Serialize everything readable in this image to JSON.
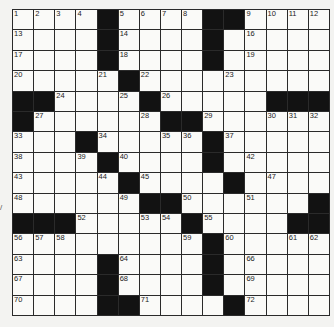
{
  "puzzle": {
    "rows": 15,
    "cols": 15,
    "grid": [
      "....#....##....",
      "....#....#.....",
      "....#....#.....",
      ".....#.........",
      "##....#.....###",
      "#......##......",
      "...#.....#.....",
      "....#....#.....",
      ".....#....#....",
      "......##......#",
      "###.....#....##",
      ".........#.....",
      "....#....#.....",
      "....#....#.....",
      "....##....#...."
    ],
    "numbers": [
      {
        "n": "1",
        "r": 0,
        "c": 0
      },
      {
        "n": "2",
        "r": 0,
        "c": 1
      },
      {
        "n": "3",
        "r": 0,
        "c": 2
      },
      {
        "n": "4",
        "r": 0,
        "c": 3
      },
      {
        "n": "5",
        "r": 0,
        "c": 5
      },
      {
        "n": "6",
        "r": 0,
        "c": 6
      },
      {
        "n": "7",
        "r": 0,
        "c": 7
      },
      {
        "n": "8",
        "r": 0,
        "c": 8
      },
      {
        "n": "9",
        "r": 0,
        "c": 11
      },
      {
        "n": "10",
        "r": 0,
        "c": 12
      },
      {
        "n": "11",
        "r": 0,
        "c": 13
      },
      {
        "n": "12",
        "r": 0,
        "c": 14
      },
      {
        "n": "13",
        "r": 1,
        "c": 0
      },
      {
        "n": "14",
        "r": 1,
        "c": 5
      },
      {
        "n": "15",
        "r": 1,
        "c": 9
      },
      {
        "n": "16",
        "r": 1,
        "c": 11
      },
      {
        "n": "17",
        "r": 2,
        "c": 0
      },
      {
        "n": "18",
        "r": 2,
        "c": 5
      },
      {
        "n": "19",
        "r": 2,
        "c": 11
      },
      {
        "n": "20",
        "r": 3,
        "c": 0
      },
      {
        "n": "21",
        "r": 3,
        "c": 4
      },
      {
        "n": "22",
        "r": 3,
        "c": 6
      },
      {
        "n": "23",
        "r": 3,
        "c": 10
      },
      {
        "n": "24",
        "r": 4,
        "c": 2
      },
      {
        "n": "25",
        "r": 4,
        "c": 5
      },
      {
        "n": "26",
        "r": 4,
        "c": 7
      },
      {
        "n": "27",
        "r": 5,
        "c": 1
      },
      {
        "n": "28",
        "r": 5,
        "c": 6
      },
      {
        "n": "29",
        "r": 5,
        "c": 9
      },
      {
        "n": "30",
        "r": 5,
        "c": 12
      },
      {
        "n": "31",
        "r": 5,
        "c": 13
      },
      {
        "n": "32",
        "r": 5,
        "c": 14
      },
      {
        "n": "33",
        "r": 6,
        "c": 0
      },
      {
        "n": "34",
        "r": 6,
        "c": 4
      },
      {
        "n": "35",
        "r": 6,
        "c": 7
      },
      {
        "n": "36",
        "r": 6,
        "c": 8
      },
      {
        "n": "37",
        "r": 6,
        "c": 10
      },
      {
        "n": "38",
        "r": 7,
        "c": 0
      },
      {
        "n": "39",
        "r": 7,
        "c": 3
      },
      {
        "n": "40",
        "r": 7,
        "c": 5
      },
      {
        "n": "41",
        "r": 7,
        "c": 9
      },
      {
        "n": "42",
        "r": 7,
        "c": 11
      },
      {
        "n": "43",
        "r": 8,
        "c": 0
      },
      {
        "n": "44",
        "r": 8,
        "c": 4
      },
      {
        "n": "45",
        "r": 8,
        "c": 6
      },
      {
        "n": "46",
        "r": 8,
        "c": 10
      },
      {
        "n": "47",
        "r": 8,
        "c": 12
      },
      {
        "n": "48",
        "r": 9,
        "c": 0
      },
      {
        "n": "49",
        "r": 9,
        "c": 5
      },
      {
        "n": "50",
        "r": 9,
        "c": 8
      },
      {
        "n": "51",
        "r": 9,
        "c": 11
      },
      {
        "n": "52",
        "r": 10,
        "c": 3
      },
      {
        "n": "53",
        "r": 10,
        "c": 6
      },
      {
        "n": "54",
        "r": 10,
        "c": 7
      },
      {
        "n": "55",
        "r": 10,
        "c": 9
      },
      {
        "n": "56",
        "r": 11,
        "c": 0
      },
      {
        "n": "57",
        "r": 11,
        "c": 1
      },
      {
        "n": "58",
        "r": 11,
        "c": 2
      },
      {
        "n": "59",
        "r": 11,
        "c": 8
      },
      {
        "n": "60",
        "r": 11,
        "c": 10
      },
      {
        "n": "61",
        "r": 11,
        "c": 13
      },
      {
        "n": "62",
        "r": 11,
        "c": 14
      },
      {
        "n": "63",
        "r": 12,
        "c": 0
      },
      {
        "n": "64",
        "r": 12,
        "c": 5
      },
      {
        "n": "65",
        "r": 12,
        "c": 9
      },
      {
        "n": "66",
        "r": 12,
        "c": 11
      },
      {
        "n": "67",
        "r": 13,
        "c": 0
      },
      {
        "n": "68",
        "r": 13,
        "c": 5
      },
      {
        "n": "69",
        "r": 13,
        "c": 11
      },
      {
        "n": "70",
        "r": 14,
        "c": 0
      },
      {
        "n": "71",
        "r": 14,
        "c": 6
      },
      {
        "n": "72",
        "r": 14,
        "c": 11
      }
    ]
  },
  "stray_mark": "/"
}
